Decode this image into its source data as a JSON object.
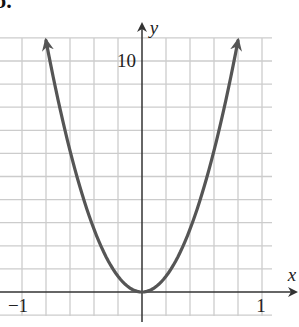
{
  "panel_label": "b.",
  "chart_data": {
    "type": "line",
    "title": "",
    "xlabel": "x",
    "ylabel": "y",
    "x_tick_labels": [
      "-1",
      "1"
    ],
    "y_tick_labels": [
      "10"
    ],
    "xlim": [
      -1.0,
      1.2
    ],
    "ylim": [
      -1,
      11.5
    ],
    "grid": true,
    "grid_step_x": 0.2,
    "grid_step_y": 1,
    "series": [
      {
        "name": "y = a x^2 (parabola, a≈17)",
        "x": [
          -0.8,
          -0.7,
          -0.6,
          -0.5,
          -0.4,
          -0.3,
          -0.2,
          -0.1,
          0.0,
          0.1,
          0.2,
          0.3,
          0.4,
          0.5,
          0.6,
          0.7,
          0.8
        ],
        "values": [
          10.9,
          8.3,
          6.1,
          4.25,
          2.72,
          1.53,
          0.68,
          0.17,
          0.0,
          0.17,
          0.68,
          1.53,
          2.72,
          4.25,
          6.1,
          8.3,
          10.9
        ],
        "arrows_at_ends": true
      }
    ],
    "colors": {
      "curve": "#555555",
      "axes": "#333333",
      "grid": "#cccccc"
    }
  }
}
